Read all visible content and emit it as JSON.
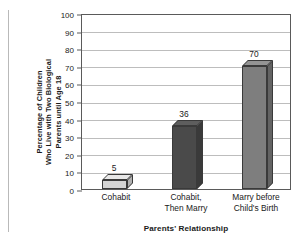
{
  "chart_data": {
    "type": "bar",
    "title": "",
    "categories": [
      "Cohabit",
      "Cohabit, Then Marry",
      "Marry before Child's Birth"
    ],
    "category_lines": [
      [
        "Cohabit"
      ],
      [
        "Cohabit,",
        "Then Marry"
      ],
      [
        "Marry before",
        "Child's Birth"
      ]
    ],
    "values": [
      5,
      36,
      70
    ],
    "value_labels": [
      "5",
      "36",
      "70"
    ],
    "bar_colors": [
      "#d4d4d4",
      "#4a4a4a",
      "#7e7e7e"
    ],
    "bar_top_colors": [
      "#e8e8e8",
      "#5e5e5e",
      "#949494"
    ],
    "bar_side_colors": [
      "#b0b0b0",
      "#3a3a3a",
      "#636363"
    ],
    "xlabel": "Parents' Relationship",
    "ylabel_lines": [
      "Percentage of Children",
      "Who Live with Two Biological",
      "Parents until Age 18"
    ],
    "ylim": [
      0,
      100
    ],
    "ytick_step": 10,
    "yticks": [
      "0",
      "10",
      "20",
      "30",
      "40",
      "50",
      "60",
      "70",
      "80",
      "90",
      "100"
    ],
    "grid": true,
    "legend": "none",
    "frame_color": "#5a5a5a",
    "grid_color": "#bdbdbd"
  }
}
